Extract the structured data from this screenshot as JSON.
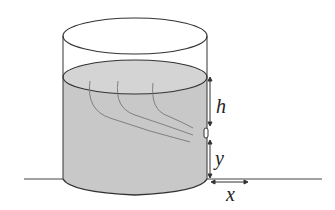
{
  "diagram": {
    "labels": {
      "h": "h",
      "y": "y",
      "x": "x"
    },
    "colors": {
      "water": "#c8c8c8",
      "water_top": "#d4d4d4",
      "stroke": "#333333",
      "streamline": "#666666",
      "background": "#ffffff"
    }
  }
}
